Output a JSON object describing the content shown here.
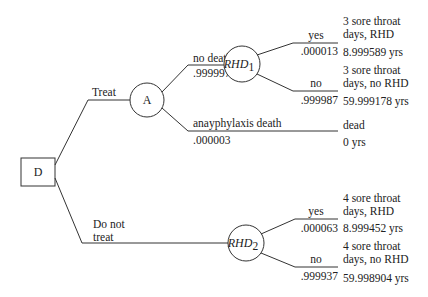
{
  "diagram": {
    "type": "decision-tree",
    "decision_node": {
      "label": "D"
    },
    "branches": {
      "treat": {
        "label": "Treat"
      },
      "do_not_treat": {
        "label_line1": "Do not",
        "label_line2": "treat"
      }
    },
    "chance_node_a": {
      "label": "A"
    },
    "node_a_branches": {
      "no_death": {
        "label": "no death",
        "prob": ".999997"
      },
      "anaphylaxis_death": {
        "label": "anayphylaxis death",
        "prob": ".000003"
      }
    },
    "rhd1": {
      "label": "RHD",
      "sub": "1",
      "yes": {
        "label": "yes",
        "prob": ".000013"
      },
      "no": {
        "label": "no",
        "prob": ".999987"
      }
    },
    "rhd2": {
      "label": "RHD",
      "sub": "2",
      "yes": {
        "label": "yes",
        "prob": ".000063"
      },
      "no": {
        "label": "no",
        "prob": ".999937"
      }
    },
    "outcomes": {
      "treat_rhd": {
        "line1": "3 sore throat",
        "line2": "days, RHD",
        "value": "8.999589 yrs"
      },
      "treat_no_rhd": {
        "line1": "3 sore throat",
        "line2": "days, no RHD",
        "value": "59.999178 yrs"
      },
      "treat_dead": {
        "line1": "dead",
        "value": "0 yrs"
      },
      "notreat_rhd": {
        "line1": "4 sore throat",
        "line2": "days, RHD",
        "value": "8.999452 yrs"
      },
      "notreat_no_rhd": {
        "line1": "4 sore throat",
        "line2": "days, no RHD",
        "value": "59.998904 yrs"
      }
    }
  }
}
